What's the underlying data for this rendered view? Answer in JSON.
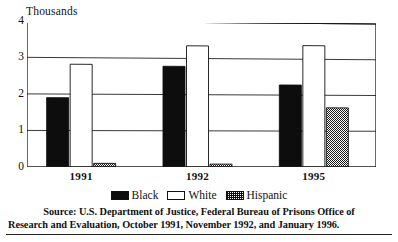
{
  "figure": {
    "axis_title": "Thousands",
    "source_line1": "Source: U.S. Department of Justice, Federal Bureau of Prisons Office of",
    "source_line2": "Research and Evaluation, October 1991, November 1992, and January 1996."
  },
  "legend": {
    "entries": [
      {
        "label": "Black",
        "swatch": "solid-black-swatch",
        "color": "#0d0d0d"
      },
      {
        "label": "White",
        "swatch": "outline-white-swatch",
        "color": "#ffffff"
      },
      {
        "label": "Hispanic",
        "swatch": "crosshatch-swatch",
        "color": "#888888"
      }
    ]
  },
  "chart_data": {
    "type": "bar",
    "title": "",
    "subtitle": "",
    "xlabel": "",
    "ylabel": "Thousands",
    "categories": [
      "1991",
      "1992",
      "1995"
    ],
    "series": [
      {
        "name": "Black",
        "values": [
          1.9,
          2.78,
          2.28
        ],
        "fill": "#0d0d0d"
      },
      {
        "name": "White",
        "values": [
          2.82,
          3.35,
          3.38
        ],
        "fill": "#ffffff"
      },
      {
        "name": "Hispanic",
        "values": [
          0.1,
          0.08,
          1.65
        ],
        "fill": "crosshatch"
      }
    ],
    "ylim": [
      0,
      4
    ],
    "yticks": [
      0,
      1,
      2,
      3,
      4
    ],
    "ytick_labels": [
      "0",
      "1",
      "2",
      "3",
      "4"
    ],
    "grid": true,
    "grid_axis": "y",
    "legend_position": "bottom"
  }
}
